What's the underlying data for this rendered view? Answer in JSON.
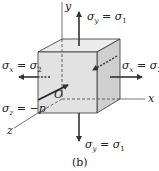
{
  "figure": {
    "caption": "(b)",
    "axes": {
      "x": "x",
      "y": "y",
      "z": "z",
      "origin": "O"
    },
    "labels": {
      "top": {
        "sym": "σ",
        "sub": "y",
        "rhs": "σ",
        "rhs_sub": "1"
      },
      "bottom": {
        "sym": "σ",
        "sub": "y",
        "rhs": "σ",
        "rhs_sub": "1"
      },
      "left": {
        "sym": "σ",
        "sub": "x",
        "rhs": "σ",
        "rhs_sub": "2"
      },
      "right": {
        "sym": "σ",
        "sub": "x",
        "rhs": "σ",
        "rhs_sub": "2"
      },
      "z": {
        "sym": "σ",
        "sub": "z",
        "rhs": "−p"
      }
    },
    "colors": {
      "front_face": "#e2e2e2",
      "top_face": "#ececec",
      "side_face": "#d0d0d0",
      "stroke": "#333333"
    }
  }
}
